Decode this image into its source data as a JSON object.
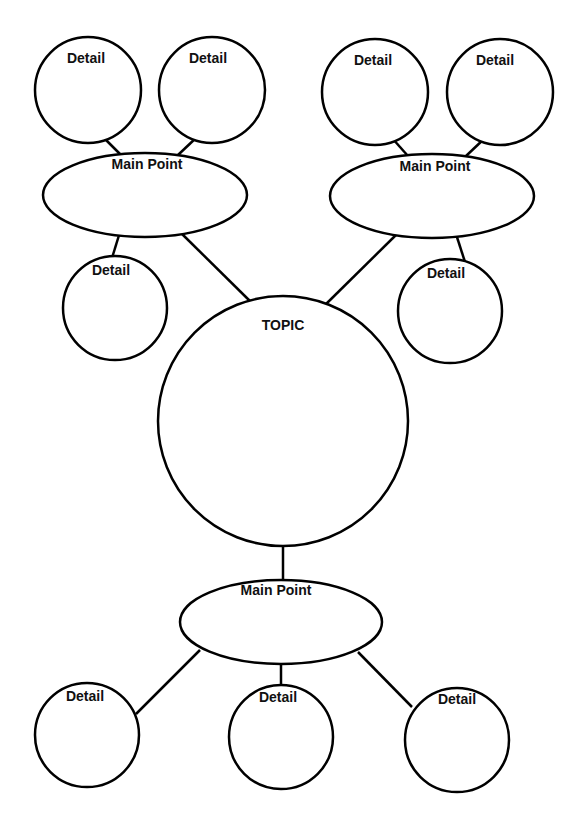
{
  "diagram": {
    "type": "bubble map",
    "topic": {
      "label": "TOPIC"
    },
    "main_points": [
      {
        "label": "Main Point",
        "details": [
          "Detail",
          "Detail",
          "Detail"
        ]
      },
      {
        "label": "Main Point",
        "details": [
          "Detail",
          "Detail",
          "Detail"
        ]
      },
      {
        "label": "Main Point",
        "details": [
          "Detail",
          "Detail",
          "Detail"
        ]
      }
    ]
  },
  "colors": {
    "stroke": "#000000",
    "background": "#ffffff"
  }
}
